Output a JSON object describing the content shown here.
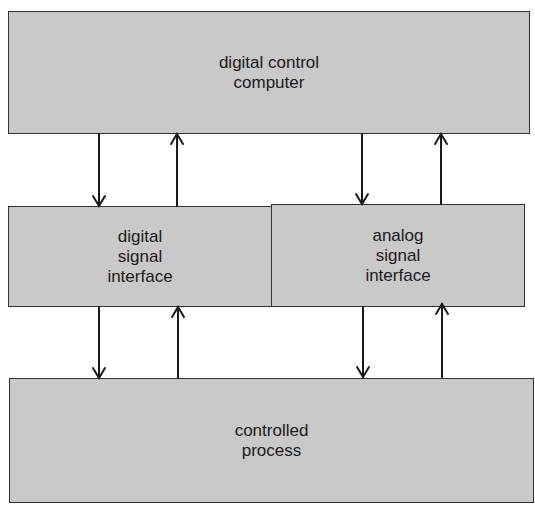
{
  "diagram": {
    "title": "",
    "nodes": [
      {
        "id": "computer",
        "label": "digital control\ncomputer"
      },
      {
        "id": "digital_interface",
        "label": "digital\nsignal\ninterface"
      },
      {
        "id": "analog_interface",
        "label": "analog\nsignal\ninterface"
      },
      {
        "id": "process",
        "label": "controlled\nprocess"
      }
    ],
    "edges": [
      {
        "from": "computer",
        "to": "digital_interface"
      },
      {
        "from": "digital_interface",
        "to": "computer"
      },
      {
        "from": "computer",
        "to": "analog_interface"
      },
      {
        "from": "analog_interface",
        "to": "computer"
      },
      {
        "from": "digital_interface",
        "to": "process"
      },
      {
        "from": "process",
        "to": "digital_interface"
      },
      {
        "from": "analog_interface",
        "to": "process"
      },
      {
        "from": "process",
        "to": "analog_interface"
      }
    ],
    "colors": {
      "box_fill": "#c9c9c9",
      "stroke": "#333333",
      "background": "#ffffff"
    }
  }
}
